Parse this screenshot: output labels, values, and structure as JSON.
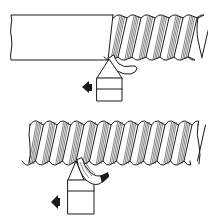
{
  "figure": {
    "panels": [
      {
        "id": "first-pass",
        "workpiece": {
          "state": "partially threaded bar",
          "threaded_portion": "right",
          "plain_portion": "left"
        },
        "tool": {
          "chip": "curled single chip"
        },
        "feed_direction": "left"
      },
      {
        "id": "final-pass",
        "workpiece": {
          "state": "fully threaded bar"
        },
        "tool": {
          "chip": "curled multi-strand chip"
        },
        "feed_direction": "left"
      }
    ],
    "colors": {
      "ink": "#1a1a1a",
      "background": "#ffffff"
    }
  }
}
